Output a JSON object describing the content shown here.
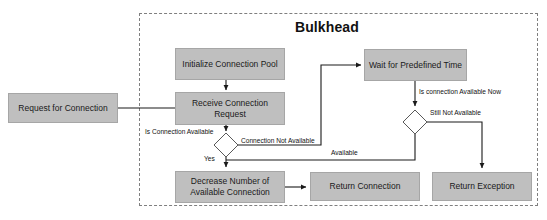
{
  "diagram": {
    "type": "flowchart",
    "title": "Bulkhead",
    "group": {
      "label": "Bulkhead",
      "style": "dashed-border"
    },
    "colors": {
      "node_fill": "#bfbfbf",
      "node_border": "#a6a6a6",
      "edge": "#1a1a1a",
      "group_border": "#7f7f7f",
      "text": "#1a1a1a",
      "background": "#ffffff"
    },
    "nodes": [
      {
        "id": "request",
        "label": "Request for Connection",
        "shape": "rect",
        "inside_group": false
      },
      {
        "id": "init_pool",
        "label": "Initialize Connection Pool",
        "shape": "rect",
        "inside_group": true
      },
      {
        "id": "receive",
        "label": "Receive Connection Request",
        "shape": "rect",
        "inside_group": true
      },
      {
        "id": "wait",
        "label": "Wait for Predefined Time",
        "shape": "rect",
        "inside_group": true
      },
      {
        "id": "decision_avail",
        "label": "",
        "shape": "diamond",
        "inside_group": true
      },
      {
        "id": "decision_now",
        "label": "",
        "shape": "diamond",
        "inside_group": true
      },
      {
        "id": "decrease",
        "label": "Decrease Number of Available Connection",
        "shape": "rect",
        "inside_group": true
      },
      {
        "id": "return_conn",
        "label": "Return Connection",
        "shape": "rect",
        "inside_group": true
      },
      {
        "id": "return_exc",
        "label": "Return Exception",
        "shape": "rect",
        "inside_group": true
      }
    ],
    "edges": [
      {
        "from": "request",
        "to": "receive",
        "label": ""
      },
      {
        "from": "init_pool",
        "to": "receive",
        "label": ""
      },
      {
        "from": "receive",
        "to": "decision_avail",
        "label": "Is Connection Available"
      },
      {
        "from": "decision_avail",
        "to": "wait",
        "label": "Connection Not Available"
      },
      {
        "from": "decision_avail",
        "to": "decrease",
        "label": "Yes"
      },
      {
        "from": "wait",
        "to": "decision_now",
        "label": "Is connection Available Now"
      },
      {
        "from": "decision_now",
        "to": "return_exc",
        "label": "Still Not Available"
      },
      {
        "from": "decision_now",
        "to": "decrease",
        "label": "Available"
      },
      {
        "from": "decrease",
        "to": "return_conn",
        "label": ""
      }
    ],
    "labels": {
      "request": "Request for Connection",
      "init_pool": "Initialize Connection Pool",
      "receive": "Receive Connection Request",
      "wait": "Wait for Predefined Time",
      "decrease": "Decrease Number of Available Connection",
      "return_conn": "Return Connection",
      "return_exc": "Return Exception",
      "is_connection_available": "Is Connection Available",
      "connection_not_available": "Connection Not Available",
      "yes": "Yes",
      "is_connection_available_now": "Is connection Available Now",
      "still_not_available": "Still Not Available",
      "available": "Available"
    }
  }
}
